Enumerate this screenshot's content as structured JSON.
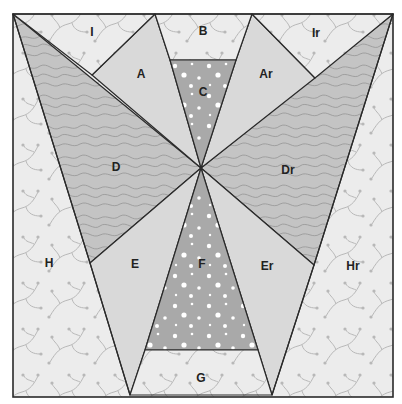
{
  "diagram": {
    "colors": {
      "background_print": "#ececec",
      "light_solid": "#d9d9d9",
      "topo_print": "#c4c4c4",
      "dotted_print": "#a9a9a9",
      "outline": "#2a2a2a",
      "vine_motif": "#b8b8b8",
      "topo_lines": "#9a9a9a",
      "dots": "#ffffff"
    },
    "pieces": [
      {
        "id": "I",
        "label": "I",
        "fabric": "background_print"
      },
      {
        "id": "B",
        "label": "B",
        "fabric": "background_print"
      },
      {
        "id": "Ir",
        "label": "Ir",
        "fabric": "background_print"
      },
      {
        "id": "A",
        "label": "A",
        "fabric": "light_solid"
      },
      {
        "id": "C",
        "label": "C",
        "fabric": "dotted_print"
      },
      {
        "id": "Ar",
        "label": "Ar",
        "fabric": "light_solid"
      },
      {
        "id": "D",
        "label": "D",
        "fabric": "topo_print"
      },
      {
        "id": "Dr",
        "label": "Dr",
        "fabric": "topo_print"
      },
      {
        "id": "H",
        "label": "H",
        "fabric": "background_print"
      },
      {
        "id": "E",
        "label": "E",
        "fabric": "light_solid"
      },
      {
        "id": "F",
        "label": "F",
        "fabric": "dotted_print"
      },
      {
        "id": "Er",
        "label": "Er",
        "fabric": "light_solid"
      },
      {
        "id": "Hr",
        "label": "Hr",
        "fabric": "background_print"
      },
      {
        "id": "G",
        "label": "G",
        "fabric": "background_print"
      }
    ]
  }
}
